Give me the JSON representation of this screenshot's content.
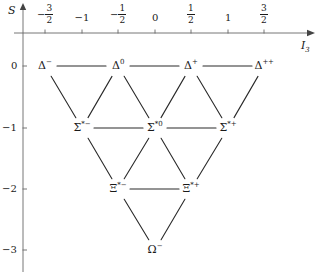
{
  "figure": {
    "type": "weight-diagram",
    "axes": {
      "y_label": "S",
      "x_label": "I",
      "x_label_sub": "3"
    },
    "x_ticks": [
      {
        "label": "-3/2",
        "sign": "−",
        "num": "3",
        "den": "2",
        "value": -1.5,
        "px": 45
      },
      {
        "label": "-1",
        "text": "−1",
        "value": -1.0,
        "px": 82
      },
      {
        "label": "-1/2",
        "sign": "−",
        "num": "1",
        "den": "2",
        "value": -0.5,
        "px": 118
      },
      {
        "label": "0",
        "text": "0",
        "value": 0.0,
        "px": 155
      },
      {
        "label": "1/2",
        "sign": "",
        "num": "1",
        "den": "2",
        "value": 0.5,
        "px": 191
      },
      {
        "label": "1",
        "text": "1",
        "value": 1.0,
        "px": 228
      },
      {
        "label": "3/2",
        "sign": "",
        "num": "3",
        "den": "2",
        "value": 1.5,
        "px": 264
      }
    ],
    "y_ticks": [
      {
        "text": "0",
        "value": 0,
        "px": 66
      },
      {
        "text": "−1",
        "value": -1,
        "px": 128
      },
      {
        "text": "−2",
        "value": -2,
        "px": 189
      },
      {
        "text": "−3",
        "value": -3,
        "px": 250
      }
    ],
    "nodes": [
      {
        "id": "delta-minus",
        "base": "Δ",
        "star": "",
        "sup": "−",
        "i3": -1.5,
        "s": 0,
        "x": 45,
        "y": 66
      },
      {
        "id": "delta-zero",
        "base": "Δ",
        "star": "",
        "sup": "0",
        "i3": -0.5,
        "s": 0,
        "x": 118,
        "y": 66
      },
      {
        "id": "delta-plus",
        "base": "Δ",
        "star": "",
        "sup": "+",
        "i3": 0.5,
        "s": 0,
        "x": 191,
        "y": 66
      },
      {
        "id": "delta-plusplus",
        "base": "Δ",
        "star": "",
        "sup": "++",
        "i3": 1.5,
        "s": 0,
        "x": 264,
        "y": 66
      },
      {
        "id": "sigma-star-minus",
        "base": "Σ",
        "star": "*",
        "sup": "−",
        "i3": -1.0,
        "s": -1,
        "x": 82,
        "y": 128
      },
      {
        "id": "sigma-star-zero",
        "base": "Σ",
        "star": "*",
        "sup": "0",
        "i3": 0.0,
        "s": -1,
        "x": 155,
        "y": 128
      },
      {
        "id": "sigma-star-plus",
        "base": "Σ",
        "star": "*",
        "sup": "+",
        "i3": 1.0,
        "s": -1,
        "x": 228,
        "y": 128
      },
      {
        "id": "xi-star-minus",
        "base": "Ξ",
        "star": "*",
        "sup": "−",
        "i3": -0.5,
        "s": -2,
        "x": 118,
        "y": 189
      },
      {
        "id": "xi-star-plus",
        "base": "Ξ",
        "star": "*",
        "sup": "+",
        "i3": 0.5,
        "s": -2,
        "x": 191,
        "y": 189
      },
      {
        "id": "omega-minus",
        "base": "Ω",
        "star": "",
        "sup": "−",
        "i3": 0.0,
        "s": -3,
        "x": 155,
        "y": 250
      }
    ],
    "edges": [
      {
        "from": "delta-minus",
        "to": "delta-zero"
      },
      {
        "from": "delta-zero",
        "to": "delta-plus"
      },
      {
        "from": "delta-plus",
        "to": "delta-plusplus"
      },
      {
        "from": "sigma-star-minus",
        "to": "sigma-star-zero"
      },
      {
        "from": "sigma-star-zero",
        "to": "sigma-star-plus"
      },
      {
        "from": "xi-star-minus",
        "to": "xi-star-plus"
      },
      {
        "from": "delta-minus",
        "to": "sigma-star-minus"
      },
      {
        "from": "delta-zero",
        "to": "sigma-star-minus"
      },
      {
        "from": "delta-zero",
        "to": "sigma-star-zero"
      },
      {
        "from": "delta-plus",
        "to": "sigma-star-zero"
      },
      {
        "from": "delta-plus",
        "to": "sigma-star-plus"
      },
      {
        "from": "delta-plusplus",
        "to": "sigma-star-plus"
      },
      {
        "from": "sigma-star-minus",
        "to": "xi-star-minus"
      },
      {
        "from": "sigma-star-zero",
        "to": "xi-star-minus"
      },
      {
        "from": "sigma-star-zero",
        "to": "xi-star-plus"
      },
      {
        "from": "sigma-star-plus",
        "to": "xi-star-plus"
      },
      {
        "from": "xi-star-minus",
        "to": "omega-minus"
      },
      {
        "from": "xi-star-plus",
        "to": "omega-minus"
      }
    ],
    "geometry": {
      "origin_x": 23,
      "origin_y": 33,
      "x_axis_end": 307,
      "y_axis_end": 272,
      "y_axis_top": 10
    },
    "colors": {
      "ink": "#1a1a1a",
      "axis": "#555555",
      "edge": "#2a2a2a",
      "background": "#ffffff"
    }
  }
}
